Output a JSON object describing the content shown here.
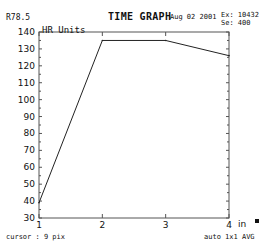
{
  "header": {
    "left_value": "R78.5",
    "title": "TIME GRAPH",
    "date": "Aug 02 2001",
    "ex_line": "Ex: 10432",
    "se_line": "Se: 400"
  },
  "footer": {
    "cursor_text": "cursor :  9 pix",
    "mode_text": "auto 1x1 AVG"
  },
  "chart_data": {
    "type": "line",
    "title": "TIME GRAPH",
    "ylabel": "HR Units",
    "xlabel": "",
    "x_unit_label": "in",
    "x": [
      1,
      2,
      3,
      4
    ],
    "series": [
      {
        "name": "HR Units",
        "values": [
          39,
          135,
          135,
          126
        ]
      }
    ],
    "xlim": [
      1,
      4
    ],
    "ylim": [
      30,
      140
    ],
    "x_ticks": [
      1,
      2,
      3,
      4
    ],
    "y_ticks": [
      30,
      40,
      50,
      60,
      70,
      80,
      90,
      100,
      110,
      120,
      130,
      140
    ],
    "grid": false,
    "legend": "none"
  }
}
